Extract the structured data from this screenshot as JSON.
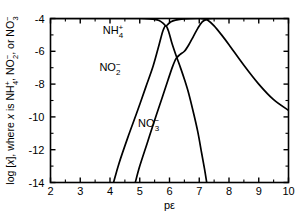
{
  "chart_data": {
    "type": "line",
    "title": "",
    "xlabel": "pε",
    "ylabel": "log [x], where x is NH4+, NO2-, or NO3-",
    "ylabel_parts": {
      "lead": "log [",
      "var": "x",
      "mid": "], where ",
      "var2": "x",
      "is": " is NH",
      "nh4_sub": "4",
      "nh4_sup": "+",
      "sep1": ", NO",
      "no2_sub": "2",
      "no2_sup": "−",
      "sep2": ", or NO",
      "no3_sub": "3",
      "no3_sup": "−"
    },
    "xlim": [
      2,
      10
    ],
    "ylim": [
      -14,
      -4
    ],
    "xticks": [
      2,
      3,
      4,
      5,
      6,
      7,
      8,
      9,
      10
    ],
    "xtick_labels": [
      "2",
      "3",
      "4",
      "5",
      "6",
      "7",
      "8",
      "9",
      "10"
    ],
    "xminor_step": 0.5,
    "yticks": [
      -14,
      -12,
      -10,
      -8,
      -6,
      -4
    ],
    "ytick_labels": [
      "-14",
      "-12",
      "-10",
      "-8",
      "-6",
      "-4"
    ],
    "yminor_step": 1,
    "grid": false,
    "legend_position": "inline-annotations",
    "frame": "box",
    "series": [
      {
        "name": "NH4+",
        "label_parts": {
          "base": "NH",
          "sub": "4",
          "sup": "+"
        },
        "label_x": 4.1,
        "label_y": -4.95,
        "points": [
          [
            2.0,
            -4.0
          ],
          [
            2.5,
            -4.0
          ],
          [
            3.0,
            -4.0
          ],
          [
            3.5,
            -4.0
          ],
          [
            4.0,
            -4.0
          ],
          [
            4.5,
            -4.0
          ],
          [
            5.0,
            -4.0
          ],
          [
            5.3,
            -4.02
          ],
          [
            5.5,
            -4.05
          ],
          [
            5.65,
            -4.12
          ],
          [
            5.78,
            -4.28
          ],
          [
            5.88,
            -4.45
          ],
          [
            5.95,
            -4.35
          ],
          [
            6.05,
            -4.2
          ],
          [
            6.2,
            -4.1
          ],
          [
            6.4,
            -4.04
          ],
          [
            6.7,
            -4.01
          ],
          [
            7.0,
            -4.0
          ],
          [
            7.15,
            -4.02
          ],
          [
            7.3,
            -4.12
          ],
          [
            7.5,
            -4.45
          ],
          [
            7.75,
            -5.0
          ],
          [
            8.0,
            -5.6
          ],
          [
            8.5,
            -6.85
          ],
          [
            9.0,
            -8.0
          ],
          [
            9.5,
            -8.95
          ],
          [
            10.0,
            -9.6
          ]
        ]
      },
      {
        "name": "NO2-",
        "label_parts": {
          "base": "NO",
          "sub": "2",
          "sup": "−"
        },
        "label_x": 4.0,
        "label_y": -7.2,
        "points": [
          [
            4.12,
            -14.0
          ],
          [
            4.3,
            -12.85
          ],
          [
            4.6,
            -11.25
          ],
          [
            4.9,
            -9.75
          ],
          [
            5.2,
            -8.2
          ],
          [
            5.45,
            -6.9
          ],
          [
            5.65,
            -5.6
          ],
          [
            5.78,
            -4.75
          ],
          [
            5.88,
            -4.45
          ],
          [
            5.98,
            -4.85
          ],
          [
            6.08,
            -5.5
          ],
          [
            6.2,
            -6.15
          ],
          [
            6.35,
            -6.9
          ],
          [
            6.5,
            -7.7
          ],
          [
            6.65,
            -8.6
          ],
          [
            6.8,
            -9.7
          ],
          [
            6.95,
            -10.9
          ],
          [
            7.08,
            -12.2
          ],
          [
            7.18,
            -13.2
          ],
          [
            7.25,
            -14.0
          ]
        ]
      },
      {
        "name": "NO3-",
        "label_parts": {
          "base": "NO",
          "sub": "3",
          "sup": "−"
        },
        "label_x": 5.3,
        "label_y": -10.6,
        "points": [
          [
            4.85,
            -14.0
          ],
          [
            5.0,
            -13.0
          ],
          [
            5.25,
            -11.6
          ],
          [
            5.5,
            -10.2
          ],
          [
            5.75,
            -8.85
          ],
          [
            5.95,
            -7.75
          ],
          [
            6.1,
            -6.95
          ],
          [
            6.22,
            -6.45
          ],
          [
            6.35,
            -6.2
          ],
          [
            6.5,
            -6.0
          ],
          [
            6.65,
            -5.6
          ],
          [
            6.8,
            -5.1
          ],
          [
            6.95,
            -4.6
          ],
          [
            7.1,
            -4.2
          ],
          [
            7.25,
            -4.05
          ],
          [
            7.5,
            -4.0
          ],
          [
            8.0,
            -4.0
          ],
          [
            8.5,
            -4.0
          ],
          [
            9.0,
            -4.0
          ],
          [
            9.5,
            -4.0
          ],
          [
            10.0,
            -4.0
          ]
        ]
      }
    ]
  }
}
